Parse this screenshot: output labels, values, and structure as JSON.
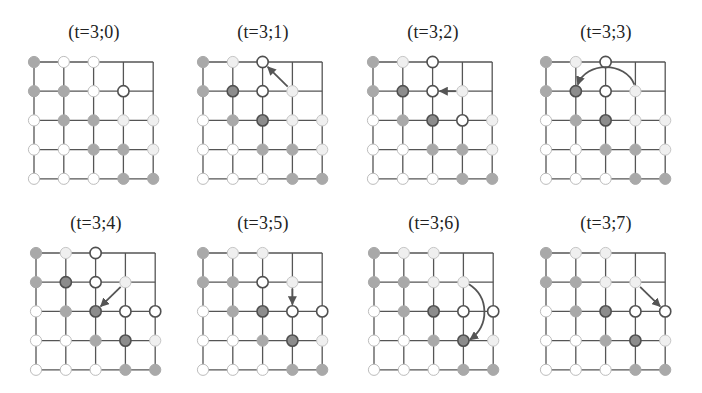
{
  "figure": {
    "grid_size": 5,
    "node_styles": {
      "gray": {
        "fill": "#a9a9a9",
        "stroke": "#a9a9a9",
        "stroke_width": 1
      },
      "dark": {
        "fill": "#8c8c8c",
        "stroke": "#505050",
        "stroke_width": 1.6
      },
      "bold": {
        "fill": "#ffffff",
        "stroke": "#505050",
        "stroke_width": 1.6
      },
      "light": {
        "fill": "#efefef",
        "stroke": "#c6c6c6",
        "stroke_width": 1
      },
      "white": {
        "fill": "#ffffff",
        "stroke": "#bdbdbd",
        "stroke_width": 1
      }
    },
    "line_color": "#555555",
    "arrow_color": "#555555",
    "panels": [
      {
        "title": "(t=3;0)",
        "nodes": [
          [
            "gray",
            "white",
            "white",
            null,
            null
          ],
          [
            "gray",
            "gray",
            "white",
            "bold",
            null
          ],
          [
            "white",
            "gray",
            "gray",
            "light",
            "light"
          ],
          [
            "white",
            "white",
            "gray",
            "gray",
            "light"
          ],
          [
            "white",
            "white",
            "white",
            "gray",
            "gray"
          ]
        ],
        "arrow": null
      },
      {
        "title": "(t=3;1)",
        "nodes": [
          [
            "gray",
            "light",
            "bold",
            null,
            null
          ],
          [
            "gray",
            "dark",
            "bold",
            "light",
            null
          ],
          [
            "white",
            "gray",
            "dark",
            "light",
            "light"
          ],
          [
            "white",
            "white",
            "gray",
            "gray",
            "light"
          ],
          [
            "white",
            "white",
            "white",
            "gray",
            "gray"
          ]
        ],
        "arrow": {
          "from": [
            3,
            1
          ],
          "to": [
            2,
            0
          ],
          "type": "straight"
        }
      },
      {
        "title": "(t=3;2)",
        "nodes": [
          [
            "gray",
            "light",
            "bold",
            null,
            null
          ],
          [
            "gray",
            "dark",
            "bold",
            "light",
            null
          ],
          [
            "white",
            "gray",
            "dark",
            "bold",
            "light"
          ],
          [
            "white",
            "white",
            "gray",
            "gray",
            "light"
          ],
          [
            "white",
            "white",
            "white",
            "gray",
            "gray"
          ]
        ],
        "arrow": {
          "from": [
            3,
            1
          ],
          "to": [
            2,
            1
          ],
          "type": "straight"
        }
      },
      {
        "title": "(t=3;3)",
        "nodes": [
          [
            "gray",
            "light",
            "bold",
            null,
            null
          ],
          [
            "gray",
            "dark",
            "bold",
            "light",
            null
          ],
          [
            "white",
            "gray",
            "dark",
            "light",
            "light"
          ],
          [
            "white",
            "white",
            "gray",
            "gray",
            "light"
          ],
          [
            "white",
            "white",
            "white",
            "gray",
            "gray"
          ]
        ],
        "arrow": {
          "from": [
            3,
            1
          ],
          "to": [
            1,
            1
          ],
          "type": "arc-up"
        }
      },
      {
        "title": "(t=3;4)",
        "nodes": [
          [
            "gray",
            "light",
            "bold",
            null,
            null
          ],
          [
            "gray",
            "dark",
            "bold",
            "light",
            null
          ],
          [
            "white",
            "gray",
            "dark",
            "bold",
            "bold"
          ],
          [
            "white",
            "white",
            "gray",
            "dark",
            "light"
          ],
          [
            "white",
            "white",
            "white",
            "gray",
            "gray"
          ]
        ],
        "arrow": {
          "from": [
            3,
            1
          ],
          "to": [
            2,
            2
          ],
          "type": "straight"
        }
      },
      {
        "title": "(t=3;5)",
        "nodes": [
          [
            "gray",
            "light",
            "light",
            null,
            null
          ],
          [
            "gray",
            "gray",
            "bold",
            "light",
            null
          ],
          [
            "white",
            "gray",
            "dark",
            "bold",
            "bold"
          ],
          [
            "white",
            "white",
            "gray",
            "dark",
            "light"
          ],
          [
            "white",
            "white",
            "white",
            "gray",
            "gray"
          ]
        ],
        "arrow": {
          "from": [
            3,
            1
          ],
          "to": [
            3,
            2
          ],
          "type": "straight"
        }
      },
      {
        "title": "(t=3;6)",
        "nodes": [
          [
            "gray",
            "light",
            "light",
            null,
            null
          ],
          [
            "gray",
            "gray",
            "light",
            "light",
            null
          ],
          [
            "white",
            "gray",
            "dark",
            "bold",
            "bold"
          ],
          [
            "white",
            "white",
            "gray",
            "dark",
            "light"
          ],
          [
            "white",
            "white",
            "white",
            "gray",
            "gray"
          ]
        ],
        "arrow": {
          "from": [
            3,
            1
          ],
          "to": [
            3,
            3
          ],
          "type": "arc-right"
        }
      },
      {
        "title": "(t=3;7)",
        "nodes": [
          [
            "gray",
            "light",
            "light",
            null,
            null
          ],
          [
            "gray",
            "gray",
            "light",
            "light",
            null
          ],
          [
            "white",
            "gray",
            "dark",
            "bold",
            "bold"
          ],
          [
            "white",
            "white",
            "gray",
            "dark",
            "light"
          ],
          [
            "white",
            "white",
            "white",
            "gray",
            "gray"
          ]
        ],
        "arrow": {
          "from": [
            3,
            1
          ],
          "to": [
            4,
            2
          ],
          "type": "straight"
        }
      }
    ]
  }
}
